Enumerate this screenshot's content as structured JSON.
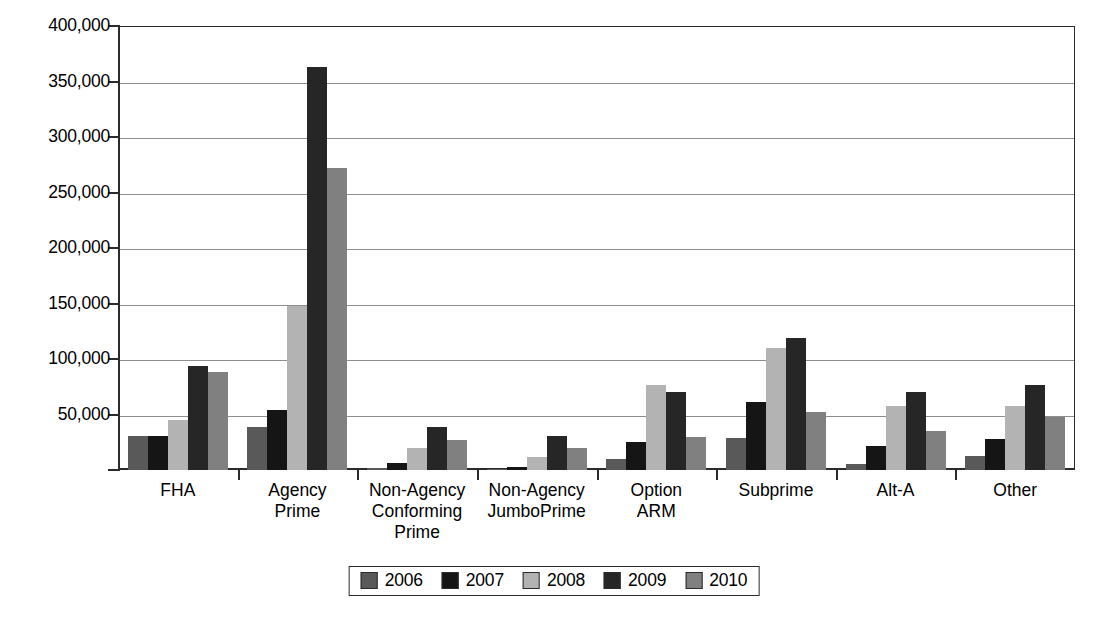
{
  "chart_data": {
    "type": "bar",
    "title": "",
    "subtitle": "",
    "xlabel": "",
    "ylabel": "",
    "ylim": [
      0,
      400000
    ],
    "ytick_step": 50000,
    "ytick_labels": [
      "400,000",
      "350,000",
      "300,000",
      "250,000",
      "200,000",
      "150,000",
      "100,000",
      "50,000",
      ""
    ],
    "ytick_values": [
      400000,
      350000,
      300000,
      250000,
      200000,
      150000,
      100000,
      50000,
      0
    ],
    "grid": true,
    "grid_axis": "y",
    "legend_position": "bottom",
    "categories": [
      "FHA",
      "Agency\nPrime",
      "Non-Agency\nConforming\nPrime",
      "Non-Agency\nJumboPrime",
      "Option\nARM",
      "Subprime",
      "Alt-A",
      "Other"
    ],
    "series": [
      {
        "name": "2006",
        "color": "#595959",
        "values": [
          31000,
          39000,
          2000,
          1000,
          10000,
          29000,
          5000,
          13000
        ]
      },
      {
        "name": "2007",
        "color": "#151515",
        "values": [
          31000,
          54000,
          6000,
          2500,
          25000,
          61000,
          22000,
          28000
        ]
      },
      {
        "name": "2008",
        "color": "#b3b3b3",
        "values": [
          45000,
          148000,
          20000,
          12000,
          77000,
          110000,
          58000,
          58000
        ]
      },
      {
        "name": "2009",
        "color": "#262626",
        "values": [
          94000,
          363000,
          39000,
          31000,
          70000,
          119000,
          70000,
          77000
        ]
      },
      {
        "name": "2010",
        "color": "#808080",
        "values": [
          88000,
          272000,
          27000,
          20000,
          30000,
          52000,
          35000,
          48000
        ]
      }
    ]
  },
  "legend": {
    "items": [
      {
        "label": "2006",
        "color": "#595959"
      },
      {
        "label": "2007",
        "color": "#151515"
      },
      {
        "label": "2008",
        "color": "#b3b3b3"
      },
      {
        "label": "2009",
        "color": "#262626"
      },
      {
        "label": "2010",
        "color": "#808080"
      }
    ]
  },
  "axis_colors": {
    "axis_line": "#2b2b2b",
    "gridline": "#8e8e8e",
    "background": "#ffffff"
  }
}
